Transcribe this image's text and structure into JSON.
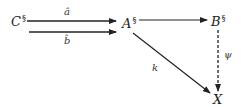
{
  "diagram": {
    "type": "commutative-diagram",
    "nodes": [
      {
        "id": "C",
        "label": "C",
        "superscript": "§"
      },
      {
        "id": "A",
        "label": "A",
        "superscript": "§"
      },
      {
        "id": "B",
        "label": "B",
        "superscript": "§"
      },
      {
        "id": "X",
        "label": "X",
        "superscript": ""
      }
    ],
    "edges": [
      {
        "from": "C",
        "to": "A",
        "label": "â",
        "style": "solid"
      },
      {
        "from": "C",
        "to": "A",
        "label": "b̂",
        "style": "solid"
      },
      {
        "from": "A",
        "to": "B",
        "label": "",
        "style": "solid"
      },
      {
        "from": "A",
        "to": "X",
        "label": "k",
        "style": "solid"
      },
      {
        "from": "B",
        "to": "X",
        "label": "ψ",
        "style": "dashed"
      }
    ]
  },
  "colors": {
    "stroke": "#222222",
    "background": "#ffffff"
  }
}
